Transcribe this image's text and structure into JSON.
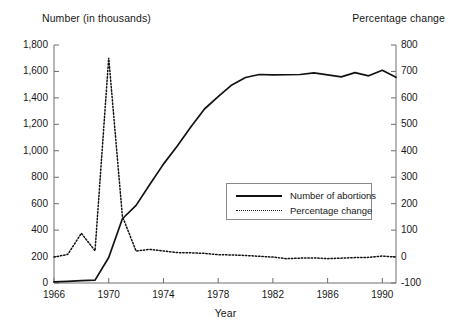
{
  "chart_data": {
    "type": "line",
    "title": "",
    "xlabel": "Year",
    "ylabel_left": "Number (in thousands)",
    "ylabel_right": "Percentage change",
    "grid": false,
    "legend_position": "center-right-inside",
    "xlim": [
      1966,
      1991
    ],
    "xticks": [
      1966,
      1970,
      1974,
      1978,
      1982,
      1986,
      1990
    ],
    "ylim_left": [
      0,
      1800
    ],
    "yticks_left": [
      "0",
      "200",
      "400",
      "600",
      "800",
      "1,000",
      "1,200",
      "1,400",
      "1,600",
      "1,800"
    ],
    "ylim_right": [
      -100,
      800
    ],
    "yticks_right": [
      "-100",
      "0",
      "100",
      "200",
      "300",
      "400",
      "500",
      "600",
      "700",
      "800"
    ],
    "x": [
      1966,
      1967,
      1968,
      1969,
      1970,
      1971,
      1972,
      1973,
      1974,
      1975,
      1976,
      1977,
      1978,
      1979,
      1980,
      1981,
      1982,
      1983,
      1984,
      1985,
      1986,
      1987,
      1988,
      1989,
      1990,
      1991
    ],
    "series": [
      {
        "name": "Number of abortions",
        "axis": "left",
        "style": "solid",
        "values": [
          8,
          13,
          18,
          22,
          193,
          486,
          587,
          745,
          899,
          1034,
          1179,
          1316,
          1409,
          1498,
          1554,
          1577,
          1574,
          1575,
          1577,
          1589,
          1574,
          1559,
          1591,
          1567,
          1609,
          1556
        ]
      },
      {
        "name": "Percentage change",
        "axis": "right",
        "style": "dotted",
        "values": [
          -2,
          8,
          88,
          22,
          752,
          152,
          21,
          27,
          21,
          15,
          14,
          12,
          7,
          6,
          4,
          1,
          -2,
          -8,
          -6,
          -5,
          -8,
          -6,
          -4,
          -3,
          2,
          -2
        ]
      }
    ]
  },
  "legend": {
    "items": [
      {
        "label": "Number of abortions",
        "style": "solid"
      },
      {
        "label": "Percentage change",
        "style": "dotted"
      }
    ]
  }
}
